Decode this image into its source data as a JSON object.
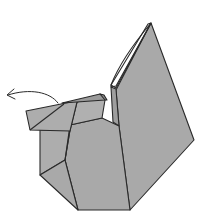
{
  "diagram": {
    "subject": "Origami squirrel folding step",
    "instruction_symbol": "Curved arrow pointing left indicating fold the head flap back",
    "colors": {
      "paper": "#a9a9a9",
      "paper_light": "#b3b3b3",
      "paper_white_side": "#ffffff",
      "outline": "#2a2a2a",
      "background": "#ffffff"
    },
    "parts": [
      {
        "name": "tail",
        "description": "tall triangular tail with white edge strip"
      },
      {
        "name": "head",
        "description": "rectangular head flap at left"
      },
      {
        "name": "body",
        "description": "octagonal body base"
      },
      {
        "name": "fold-arrow",
        "description": "curved arrow from head pointing left"
      }
    ]
  }
}
